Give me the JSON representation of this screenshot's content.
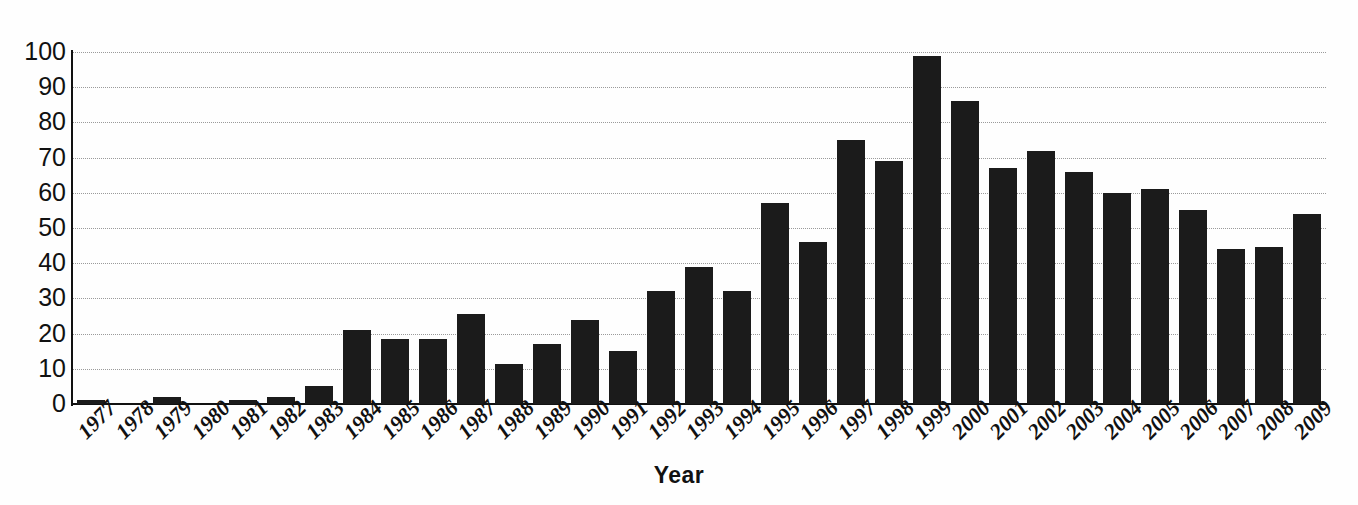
{
  "chart_data": {
    "type": "bar",
    "title": "",
    "subtitle": "",
    "xlabel": "Year",
    "ylabel": "",
    "ylim": [
      0,
      100
    ],
    "yticks": [
      0,
      10,
      20,
      30,
      40,
      50,
      60,
      70,
      80,
      90,
      100
    ],
    "grid": true,
    "grid_axis": "y",
    "grid_style": "dotted",
    "legend": false,
    "legend_position": "none",
    "bar_color": "#1b1b1b",
    "categories": [
      "1977",
      "1978",
      "1979",
      "1980",
      "1981",
      "1982",
      "1983",
      "1984",
      "1985",
      "1986",
      "1987",
      "1988",
      "1989",
      "1990",
      "1991",
      "1992",
      "1993",
      "1994",
      "1995",
      "1996",
      "1997",
      "1998",
      "1999",
      "2000",
      "2001",
      "2002",
      "2003",
      "2004",
      "2005",
      "2006",
      "2007",
      "2008",
      "2009"
    ],
    "values": [
      1,
      0,
      2,
      0,
      1,
      2,
      5,
      21,
      18.5,
      18.5,
      25.5,
      11.5,
      17,
      24,
      15,
      32,
      39,
      32,
      57,
      46,
      75,
      69,
      99,
      86,
      67,
      72,
      66,
      60,
      61,
      55,
      44,
      44.5,
      54
    ]
  },
  "axes": {
    "x_title": "Year"
  }
}
